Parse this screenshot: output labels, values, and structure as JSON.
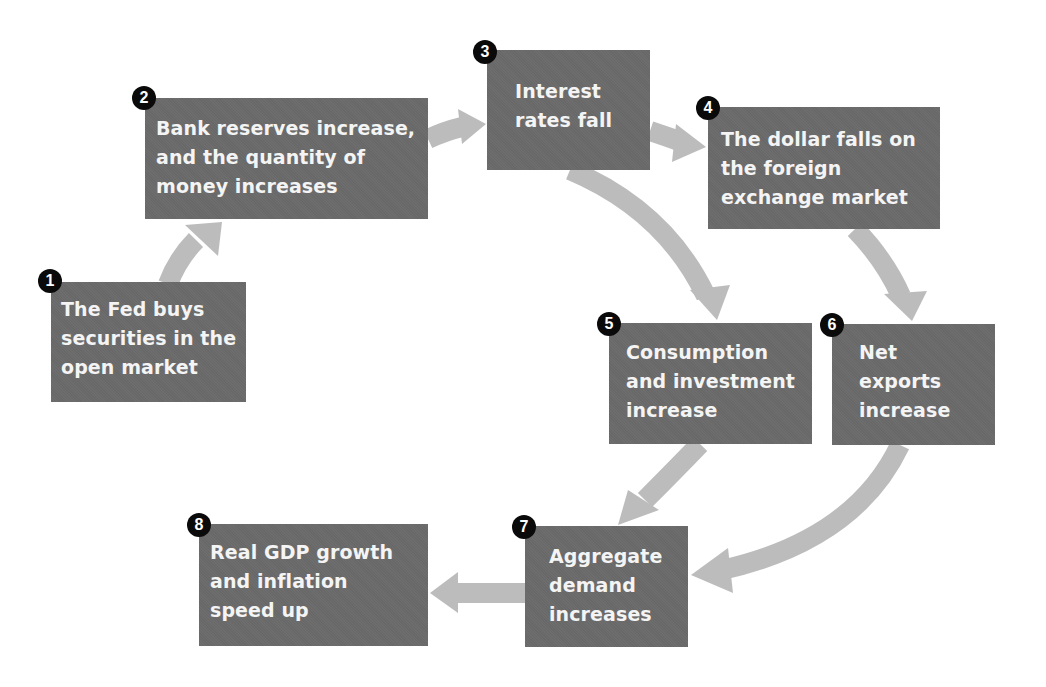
{
  "diagram": {
    "type": "flowchart",
    "colors": {
      "box_fill": "#6a6a6a",
      "box_text": "#f4f4f4",
      "arrow_fill": "#bcbcbc",
      "badge_fill": "#0a0a0a",
      "badge_text": "#ffffff",
      "background": "#ffffff"
    },
    "steps": [
      {
        "number": "1",
        "text": "The Fed buys\nsecurities in the\nopen market"
      },
      {
        "number": "2",
        "text": "Bank reserves increase,\nand the quantity of\nmoney increases"
      },
      {
        "number": "3",
        "text": "Interest\nrates fall"
      },
      {
        "number": "4",
        "text": "The dollar falls on\nthe foreign\nexchange market"
      },
      {
        "number": "5",
        "text": "Consumption\nand investment\nincrease"
      },
      {
        "number": "6",
        "text": "Net\nexports\nincrease"
      },
      {
        "number": "7",
        "text": "Aggregate\ndemand\nincreases"
      },
      {
        "number": "8",
        "text": "Real GDP growth\nand inflation\nspeed up"
      }
    ],
    "connections": [
      {
        "from": "1",
        "to": "2"
      },
      {
        "from": "2",
        "to": "3"
      },
      {
        "from": "3",
        "to": "4"
      },
      {
        "from": "3",
        "to": "5"
      },
      {
        "from": "4",
        "to": "6"
      },
      {
        "from": "5",
        "to": "7"
      },
      {
        "from": "6",
        "to": "7"
      },
      {
        "from": "7",
        "to": "8"
      }
    ]
  }
}
